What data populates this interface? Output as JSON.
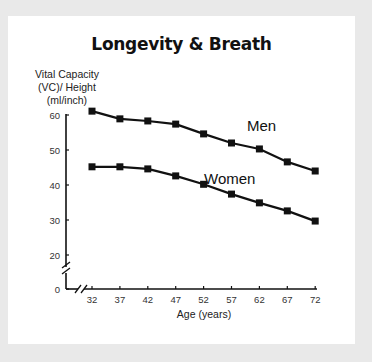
{
  "chart_data": {
    "type": "line",
    "title": "Longevity & Breath",
    "xlabel": "Age (years)",
    "ylabel": "Vital Capacity (VC)/ Height (ml/inch)",
    "ylabel_lines": [
      "Vital Capacity",
      "(VC)/ Height",
      "(ml/inch)"
    ],
    "x": [
      32,
      37,
      42,
      47,
      52,
      57,
      62,
      67,
      72
    ],
    "yticks": [
      0,
      20,
      30,
      40,
      50,
      60
    ],
    "ylim": [
      0,
      62
    ],
    "axis_breaks": {
      "x": true,
      "y": true
    },
    "grid": false,
    "legend": "inline labels",
    "series": [
      {
        "name": "Men",
        "values": [
          61.1,
          58.9,
          58.3,
          57.4,
          54.6,
          52.0,
          50.3,
          46.6,
          44.0
        ]
      },
      {
        "name": "Women",
        "values": [
          45.2,
          45.2,
          44.6,
          42.6,
          40.2,
          37.4,
          34.9,
          32.6,
          29.7
        ]
      }
    ]
  },
  "colors": {
    "background": "#e9e9e9",
    "card": "#ffffff",
    "line": "#111111"
  }
}
